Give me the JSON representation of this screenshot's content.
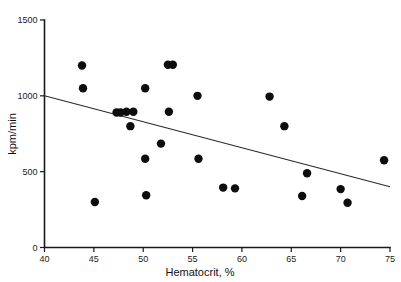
{
  "chart_data": {
    "type": "scatter",
    "title": "",
    "xlabel": "Hematocrit, %",
    "ylabel": "kpm/min",
    "xlim": [
      40,
      75
    ],
    "ylim": [
      0,
      1500
    ],
    "xticks": [
      40,
      45,
      50,
      55,
      60,
      65,
      70,
      75
    ],
    "yticks": [
      0,
      500,
      1000,
      1500
    ],
    "xtick_labels": [
      "40",
      "45",
      "50",
      "55",
      "60",
      "65",
      "70",
      "75"
    ],
    "ytick_labels": [
      "0",
      "500",
      "1000",
      "1500"
    ],
    "grid": false,
    "legend": null,
    "marker_color": "#0d0d0d",
    "marker_radius_px": 4.2,
    "line_color": "#2a2a2a",
    "points": [
      {
        "x": 43.8,
        "y": 1200
      },
      {
        "x": 43.9,
        "y": 1050
      },
      {
        "x": 45.1,
        "y": 300
      },
      {
        "x": 47.3,
        "y": 890
      },
      {
        "x": 47.7,
        "y": 890
      },
      {
        "x": 48.3,
        "y": 895
      },
      {
        "x": 48.7,
        "y": 800
      },
      {
        "x": 49.0,
        "y": 895
      },
      {
        "x": 50.2,
        "y": 1050
      },
      {
        "x": 50.2,
        "y": 585
      },
      {
        "x": 50.3,
        "y": 345
      },
      {
        "x": 51.8,
        "y": 685
      },
      {
        "x": 52.5,
        "y": 1205
      },
      {
        "x": 53.0,
        "y": 1205
      },
      {
        "x": 52.6,
        "y": 895
      },
      {
        "x": 55.5,
        "y": 1000
      },
      {
        "x": 55.6,
        "y": 585
      },
      {
        "x": 58.1,
        "y": 395
      },
      {
        "x": 59.3,
        "y": 390
      },
      {
        "x": 62.8,
        "y": 995
      },
      {
        "x": 64.3,
        "y": 800
      },
      {
        "x": 66.1,
        "y": 340
      },
      {
        "x": 66.6,
        "y": 490
      },
      {
        "x": 70.0,
        "y": 385
      },
      {
        "x": 70.7,
        "y": 295
      },
      {
        "x": 74.4,
        "y": 575
      }
    ],
    "fit_line": {
      "x_start": 40,
      "y_start": 1000,
      "x_end": 75,
      "y_end": 400
    }
  }
}
